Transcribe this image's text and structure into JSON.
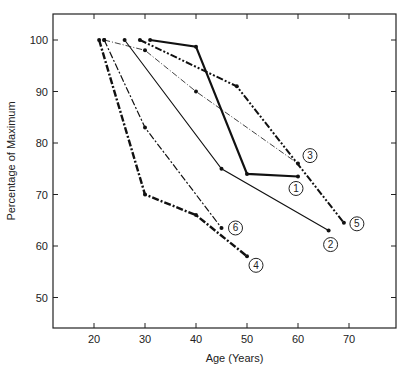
{
  "chart_data": {
    "type": "line",
    "title": "",
    "xlabel": "Age (Years)",
    "ylabel": "Percentage of Maximum",
    "xlim": [
      12,
      80
    ],
    "ylim": [
      44,
      106
    ],
    "xticks": [
      20,
      30,
      40,
      50,
      60,
      70
    ],
    "yticks": [
      50,
      60,
      70,
      80,
      90,
      100
    ],
    "xtick_labels": [
      "20",
      "30",
      "40",
      "50",
      "60",
      "70"
    ],
    "ytick_labels": [
      "50",
      "60",
      "70",
      "80",
      "90",
      "100"
    ],
    "grid": false,
    "legend": "inline-circled-numbers",
    "series": [
      {
        "name": "1",
        "style": "thick-solid",
        "x": [
          31,
          40,
          50,
          60
        ],
        "y": [
          100,
          98.7,
          74,
          73.5
        ]
      },
      {
        "name": "2",
        "style": "thin-solid",
        "x": [
          26,
          45,
          66
        ],
        "y": [
          100,
          75,
          63
        ]
      },
      {
        "name": "3",
        "style": "thin-dash-dot",
        "x": [
          22,
          30,
          40,
          60
        ],
        "y": [
          100,
          98,
          90,
          76
        ]
      },
      {
        "name": "4",
        "style": "thick-dash-dot",
        "x": [
          21,
          30,
          40,
          50
        ],
        "y": [
          100,
          70,
          66,
          58
        ]
      },
      {
        "name": "5",
        "style": "thick-dash-dot-dot",
        "x": [
          29,
          48,
          69
        ],
        "y": [
          100,
          91,
          64.5
        ]
      },
      {
        "name": "6",
        "style": "medium-dash-dot",
        "x": [
          22,
          30,
          45
        ],
        "y": [
          100,
          83,
          63.5
        ]
      }
    ]
  }
}
